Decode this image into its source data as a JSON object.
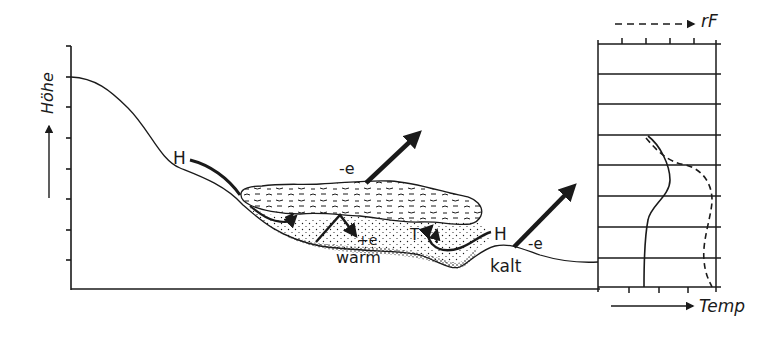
{
  "figure": {
    "colors": {
      "ink": "#1a1a1a",
      "background": "#ffffff"
    }
  },
  "left_axis": {
    "label": "Höhe",
    "arrow": "up-arrow",
    "tick_count": 8
  },
  "labels": {
    "h_left": "H",
    "h_right": "H",
    "e_fog": "-e",
    "e_warm": "+e",
    "e_kalt": "-e",
    "warm": "warm",
    "kalt": "kalt",
    "t_marker": "T"
  },
  "profile_panel": {
    "top_axis_label": "rF",
    "bottom_axis_label": "Temp",
    "top_axis_style": "dashed",
    "bottom_axis_style": "solid",
    "horizontal_lines": 8,
    "curves": [
      {
        "name": "Temp",
        "style": "solid"
      },
      {
        "name": "rF",
        "style": "dashed"
      }
    ]
  }
}
